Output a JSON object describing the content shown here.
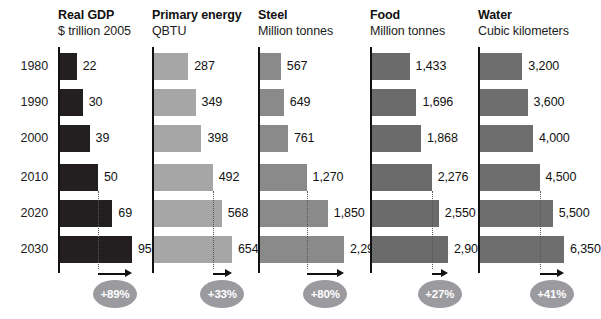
{
  "figure": {
    "years": [
      "1980",
      "1990",
      "2000",
      "2010",
      "2020",
      "2030"
    ],
    "baseline_year": "2010",
    "target_year": "2030"
  },
  "chart_data": {
    "type": "bar",
    "title": "",
    "xlabel": "",
    "ylabel": "",
    "categories": [
      "1980",
      "1990",
      "2000",
      "2010",
      "2020",
      "2030"
    ],
    "orientation": "horizontal",
    "grid": false,
    "legend": "none",
    "panels": [
      {
        "title": "Real GDP",
        "subtitle": "$ trillion 2005",
        "unit": "$ trillion 2005",
        "color": "#231f20",
        "values": [
          22,
          30,
          39,
          50,
          69,
          95
        ],
        "labels": [
          "22",
          "30",
          "39",
          "50",
          "69",
          "95"
        ],
        "xlim": [
          0,
          95
        ],
        "growth_label": "+89%",
        "growth_from": 50,
        "growth_to": 95
      },
      {
        "title": "Primary energy",
        "subtitle": "QBTU",
        "unit": "QBTU",
        "color": "#a6a6a6",
        "values": [
          287,
          349,
          398,
          492,
          568,
          654
        ],
        "labels": [
          "287",
          "349",
          "398",
          "492",
          "568",
          "654"
        ],
        "xlim": [
          0,
          654
        ],
        "growth_label": "+33%",
        "growth_from": 492,
        "growth_to": 654
      },
      {
        "title": "Steel",
        "subtitle": "Million tonnes",
        "unit": "Million tonnes",
        "color": "#8a8a8a",
        "values": [
          567,
          649,
          761,
          1270,
          1850,
          2290
        ],
        "labels": [
          "567",
          "649",
          "761",
          "1,270",
          "1,850",
          "2,290"
        ],
        "xlim": [
          0,
          2290
        ],
        "growth_label": "+80%",
        "growth_from": 1270,
        "growth_to": 2290
      },
      {
        "title": "Food",
        "subtitle": "Million tonnes",
        "unit": "Million tonnes",
        "color": "#6b6b6b",
        "values": [
          1433,
          1696,
          1868,
          2276,
          2550,
          2900
        ],
        "labels": [
          "1,433",
          "1,696",
          "1,868",
          "2,276",
          "2,550",
          "2,900"
        ],
        "xlim": [
          0,
          2900
        ],
        "growth_label": "+27%",
        "growth_from": 2276,
        "growth_to": 2900
      },
      {
        "title": "Water",
        "subtitle": "Cubic kilometers",
        "unit": "Cubic kilometers",
        "color": "#6e6e6e",
        "values": [
          3200,
          3600,
          4000,
          4500,
          5500,
          6350
        ],
        "labels": [
          "3,200",
          "3,600",
          "4,000",
          "4,500",
          "5,500",
          "6,350"
        ],
        "xlim": [
          0,
          6350
        ],
        "growth_label": "+41%",
        "growth_from": 4500,
        "growth_to": 6350
      }
    ]
  },
  "layout": {
    "panel_left": [
      58,
      152,
      258,
      370,
      478
    ],
    "panel_bar_max_px": [
      72,
      78,
      84,
      76,
      84
    ],
    "row_top": [
      53,
      89,
      125,
      164,
      200,
      236
    ],
    "bar_height": 27,
    "axis_top": 47,
    "axis_height": 226
  }
}
